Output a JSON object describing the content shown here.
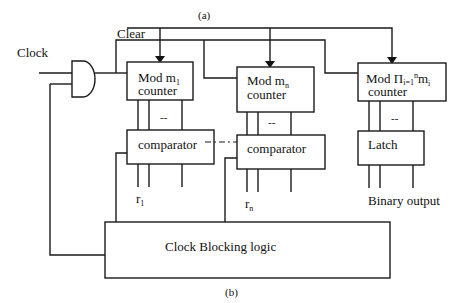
{
  "diagram": {
    "caption_top": "(a)",
    "caption_bottom": "(b)",
    "inputs": {
      "clock": "Clock",
      "clear": "Clear"
    },
    "counters": [
      {
        "prefix": "Mod m",
        "subscript": "1",
        "line2": "counter"
      },
      {
        "prefix": "Mod m",
        "subscript": "n",
        "line2": "counter"
      },
      {
        "prefix": "Mod  Π",
        "product_sub": "i=1",
        "product_sup": "n",
        "suffix": "m",
        "suffix_sub": "i",
        "line2": "counter"
      }
    ],
    "comparators": [
      {
        "label": "comparator",
        "output": "r",
        "output_sub": "1"
      },
      {
        "label": "comparator",
        "output": "r",
        "output_sub": "n"
      }
    ],
    "latch": {
      "label": "Latch",
      "output": "Binary output"
    },
    "bus_ellipsis": "--",
    "control_block": "Clock Blocking logic",
    "gate": "AND gate"
  }
}
